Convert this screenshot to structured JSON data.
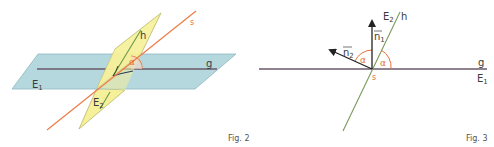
{
  "colors": {
    "plane_e1": "#b5d8de",
    "plane_e1_stroke": "#8fb7be",
    "plane_e2": "#f6f09a",
    "plane_e2_stroke": "#b9b66a",
    "line_s": "#ef7b45",
    "line_h": "#6b9a4a",
    "line_g": "#6a5a6a",
    "angle_arc": "#e8703a",
    "vector": "#222222",
    "text": "#3a3a3a",
    "accent_text": "#e8703a"
  },
  "figure2": {
    "caption": "Fig. 2",
    "labels": {
      "plane1": "E",
      "plane1_sub": "1",
      "plane2": "E",
      "plane2_sub": "2",
      "line_h": "h",
      "line_s": "s",
      "line_g": "g",
      "angle": "α"
    }
  },
  "figure3": {
    "caption": "Fig. 3",
    "labels": {
      "plane2": "E",
      "plane2_sub": "2",
      "line_h": "h",
      "normal1": "n",
      "normal1_sub": "1",
      "normal2": "n",
      "normal2_sub": "2",
      "angle_left": "α",
      "angle_right": "α",
      "point_s": "s",
      "line_g": "g",
      "plane1": "E",
      "plane1_sub": "1"
    }
  }
}
